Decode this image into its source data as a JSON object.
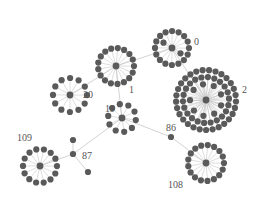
{
  "diagram": {
    "type": "network-graph",
    "colors": {
      "node": "#5a5a5a",
      "edge": "#c8c8c8",
      "label": "#555555",
      "background": "#ffffff"
    },
    "clusters": [
      {
        "id": "0",
        "label": "0",
        "cx": 172,
        "cy": 48,
        "leaves": 18,
        "radius": 17,
        "label_x": 194,
        "label_y": 45
      },
      {
        "id": "1",
        "label": "1",
        "cx": 116,
        "cy": 66,
        "leaves": 17,
        "radius": 18,
        "label_x": 129,
        "label_y": 93
      },
      {
        "id": "2",
        "label": "2",
        "cx": 206,
        "cy": 100,
        "leaves": 60,
        "radius": 30,
        "label_x": 242,
        "label_y": 93
      },
      {
        "id": "20",
        "label": "20",
        "cx": 70,
        "cy": 95,
        "leaves": 12,
        "radius": 17,
        "label_x": 83,
        "label_y": 98
      },
      {
        "id": "19",
        "label": "19",
        "cx": 122,
        "cy": 118,
        "leaves": 10,
        "radius": 14,
        "label_x": 105,
        "label_y": 112
      },
      {
        "id": "109",
        "label": "109",
        "cx": 40,
        "cy": 166,
        "leaves": 14,
        "radius": 17,
        "label_x": 17,
        "label_y": 141
      },
      {
        "id": "108",
        "label": "108",
        "cx": 206,
        "cy": 163,
        "leaves": 17,
        "radius": 18,
        "label_x": 168,
        "label_y": 188
      }
    ],
    "single_nodes": [
      {
        "id": "87",
        "label": "87",
        "x": 73,
        "y": 154,
        "label_x": 82,
        "label_y": 159
      },
      {
        "id": "87a",
        "label": "",
        "x": 73,
        "y": 140
      },
      {
        "id": "87b",
        "label": "",
        "x": 88,
        "y": 172
      },
      {
        "id": "86",
        "label": "86",
        "x": 171,
        "y": 137,
        "label_x": 166,
        "label_y": 131
      }
    ],
    "edges": [
      {
        "from": "1",
        "to": "0"
      },
      {
        "from": "1",
        "to": "20"
      },
      {
        "from": "1",
        "to": "19"
      },
      {
        "from": "0",
        "to": "2"
      },
      {
        "from": "19",
        "to": "87"
      },
      {
        "from": "19",
        "to": "86"
      },
      {
        "from": "86",
        "to": "108"
      },
      {
        "from": "87",
        "to": "109"
      },
      {
        "from": "87",
        "to": "87a"
      },
      {
        "from": "87",
        "to": "87b"
      }
    ]
  }
}
